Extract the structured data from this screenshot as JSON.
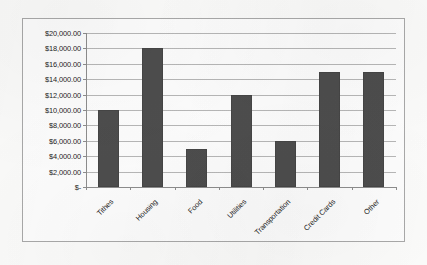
{
  "chart_data": {
    "type": "bar",
    "title": "",
    "subtitle": "",
    "xlabel": "",
    "ylabel": "",
    "categories": [
      "Tithes",
      "Housing",
      "Food",
      "Utilities",
      "Transportation",
      "Credit Cards",
      "Other"
    ],
    "values": [
      10000,
      18000,
      5000,
      12000,
      6000,
      15000,
      15000
    ],
    "ylim": [
      0,
      20000
    ],
    "ytick_values": [
      20000,
      18000,
      16000,
      14000,
      12000,
      10000,
      8000,
      6000,
      4000,
      2000,
      0
    ],
    "ytick_labels": [
      "$20,000.00",
      "$18,000.00",
      "$16,000.00",
      "$14,000.00",
      "$12,000.00",
      "$10,000.00",
      "$8,000.00",
      "$6,000.00",
      "$4,000.00",
      "$2,000.00",
      "$-"
    ],
    "grid": "horizontal",
    "legend": "none",
    "legend_entries": [],
    "annotations": [],
    "series": [
      {
        "name": "",
        "values": [
          10000,
          18000,
          5000,
          12000,
          6000,
          15000,
          15000
        ]
      }
    ]
  },
  "style": {
    "bar_color": "#4d4d4d",
    "gridline_color": "#b7b7b7",
    "axis_color": "#8d8d8d",
    "frame_color": "#a9a9a9",
    "text_color": "#1d1d1d",
    "background_color": "#fbfbfa",
    "category_label_rotation": "-45"
  }
}
